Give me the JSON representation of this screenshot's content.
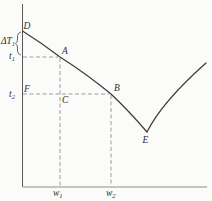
{
  "figure": {
    "point_labels": {
      "D": "D",
      "A": "A",
      "B": "B",
      "C": "C",
      "E": "E",
      "F": "F"
    },
    "axis_labels": {
      "delta_T1": {
        "main": "ΔT",
        "sub": "1"
      },
      "t1": {
        "main": "t",
        "sub": "1"
      },
      "t2": {
        "main": "t",
        "sub": "2"
      },
      "w1": {
        "main": "w",
        "sub": "1"
      },
      "w2": {
        "main": "w",
        "sub": "2"
      }
    },
    "colors": {
      "background": "#fbfbfa",
      "curve": "#3f3f3f",
      "y_axis": "#5a5a5a",
      "x_axis": "#8c8c8c",
      "dashed_guides": "#9c9c9c",
      "labels": "#2e2e2e"
    },
    "geometry": {
      "points_px": {
        "D": [
          22,
          31
        ],
        "A": [
          60,
          57
        ],
        "B": [
          111,
          94
        ],
        "C": [
          60,
          94
        ],
        "E": [
          147,
          132
        ],
        "curve_right_end": [
          206,
          63
        ]
      }
    }
  }
}
